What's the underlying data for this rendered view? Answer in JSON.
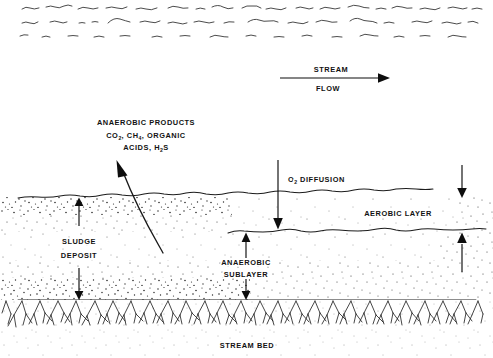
{
  "figure": {
    "background_color": "#ffffff",
    "line_color": "#1a1a1a"
  },
  "water_surface": {
    "name": "water-surface-waves",
    "row_count": 3
  },
  "flow_indicator": {
    "label_top": "STREAM",
    "label_bottom": "FLOW",
    "direction": "right"
  },
  "annotations": {
    "anaerobic_products": {
      "line1": "ANAEROBIC PRODUCTS",
      "line2_a": "CO",
      "line2_sub_a": "2",
      "line2_b": ", CH",
      "line2_sub_b": "4",
      "line2_c": ", ORGANIC",
      "line3_a": "ACIDS, H",
      "line3_sub": "2",
      "line3_b": "S"
    },
    "o2_diffusion": {
      "prefix": "O",
      "subscript": "2",
      "suffix": " DIFFUSION"
    },
    "aerobic_layer": "AEROBIC LAYER",
    "anaerobic_sublayer_line1": "ANAEROBIC",
    "anaerobic_sublayer_line2": "SUBLAYER",
    "sludge_deposit_line1": "SLUDGE",
    "sludge_deposit_line2": "DEPOSIT",
    "stream_bed": "STREAM BED"
  },
  "layers": {
    "sludge_top_y": 197,
    "aerobic_bottom_y": 231,
    "stream_bed_y": 300
  }
}
